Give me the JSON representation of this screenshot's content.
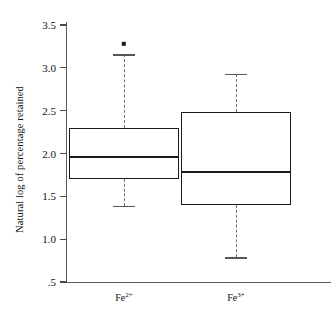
{
  "chart_data": {
    "type": "box",
    "title": "",
    "xlabel": "",
    "ylabel": "Natural log of percentage retained",
    "ylim": [
      0.5,
      3.6
    ],
    "grid": false,
    "legend": "none",
    "categories": [
      "Fe2+",
      "Fe3+"
    ],
    "ytick_labels": [
      "3.5",
      "3.0",
      "2.5",
      "2.0",
      "1.5",
      "1.0",
      ".5"
    ],
    "ytick_values": [
      3.5,
      3.0,
      2.5,
      2.0,
      1.5,
      1.0,
      0.5
    ],
    "boxes": [
      {
        "name": "Fe2+",
        "label_base": "Fe",
        "label_sup": "2+",
        "whisker_low": 1.39,
        "q1": 1.7,
        "median": 1.96,
        "q3": 2.3,
        "whisker_high": 3.16,
        "outliers": [
          3.28
        ]
      },
      {
        "name": "Fe3+",
        "label_base": "Fe",
        "label_sup": "3+",
        "whisker_low": 0.79,
        "q1": 1.4,
        "median": 1.78,
        "q3": 2.48,
        "whisker_high": 2.93,
        "outliers": []
      }
    ],
    "colors": {
      "box_edge": "#1a1a1a",
      "whisker": "#6e6e6e",
      "axis": "#5b5b5b",
      "outlier": "#1a1a1a",
      "background": "#ffffff"
    }
  }
}
